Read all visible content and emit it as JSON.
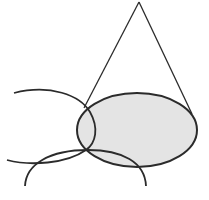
{
  "diagram": {
    "type": "geometric-figure",
    "colors": {
      "stroke": "#2b2b2b",
      "fill_base": "#e4e4e4",
      "background": "#ffffff"
    },
    "cone": {
      "apex": [
        139,
        2
      ],
      "left_base_point": [
        84,
        108
      ],
      "right_base_point": [
        192,
        114
      ]
    },
    "base_ellipse": {
      "cx": 137,
      "cy": 130,
      "rx": 60,
      "ry": 37,
      "shaded": true
    },
    "arcs": [
      {
        "name": "upper-left-arc",
        "path": "M14,93 Q70,80 92,118 Q100,140 88,150 Q60,170 7,160"
      },
      {
        "name": "lower-arc",
        "path": "M25,186 Q30,150 88,150 Q140,150 146,186"
      }
    ]
  }
}
